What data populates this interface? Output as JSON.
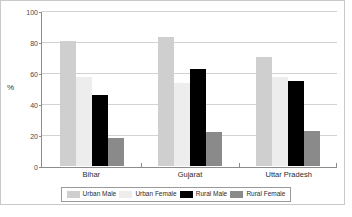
{
  "chart_data": {
    "type": "bar",
    "title": "",
    "xlabel": "",
    "ylabel": "%",
    "ylim": [
      0,
      100
    ],
    "yticks": [
      0,
      20,
      40,
      60,
      80,
      100
    ],
    "grid": true,
    "legend_position": "bottom",
    "categories": [
      "Bihar",
      "Gujarat",
      "Uttar Pradesh"
    ],
    "series": [
      {
        "name": "Urban Male",
        "color": "#cfcfcf",
        "values": [
          81,
          84,
          71
        ]
      },
      {
        "name": "Urban Female",
        "color": "#ededed",
        "values": [
          58,
          54,
          58
        ]
      },
      {
        "name": "Rural Male",
        "color": "#000000",
        "values": [
          46,
          63,
          55
        ]
      },
      {
        "name": "Rural Female",
        "color": "#8a8a8a",
        "values": [
          18,
          22,
          23
        ]
      }
    ]
  },
  "axis": {
    "y_title": "%",
    "tick_labels": [
      "100",
      "80",
      "60",
      "40",
      "20",
      "0"
    ]
  },
  "legend": {
    "items": [
      {
        "label": "Urban Male"
      },
      {
        "label": "Urban Female"
      },
      {
        "label": "Rural Male"
      },
      {
        "label": "Rural Female"
      }
    ]
  },
  "caption": {
    "text": ""
  }
}
